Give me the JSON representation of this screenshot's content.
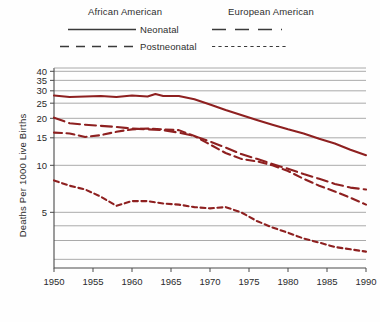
{
  "legend": {
    "group_titles": [
      {
        "id": "african-american",
        "label": "African American"
      },
      {
        "id": "european-american",
        "label": "European American"
      }
    ],
    "rows": [
      {
        "id": "neonatal",
        "label": "Neonatal"
      },
      {
        "id": "postneonatal",
        "label": "Postneonatal"
      }
    ]
  },
  "axes": {
    "ylabel": "Deaths Per 1000 Live Births",
    "xlabel": "Year"
  },
  "chart_data": {
    "type": "line",
    "title": "",
    "subtitle": "",
    "xlabel": "Year",
    "ylabel": "Deaths Per 1000 Live Births",
    "xlim": [
      1950,
      1990
    ],
    "xticks": [
      1950,
      1955,
      1960,
      1965,
      1970,
      1975,
      1980,
      1985,
      1990
    ],
    "xtick_labels": [
      "1950",
      "1955",
      "1960",
      "1965",
      "1970",
      "1975",
      "1980",
      "1985",
      "1990"
    ],
    "yscale": "log",
    "ylim": [
      2.2,
      42
    ],
    "yticks": [
      5,
      10,
      15,
      20,
      25,
      30,
      35,
      40
    ],
    "ytick_labels": [
      "5",
      "10",
      "15",
      "20",
      "25",
      "30",
      "35",
      "40"
    ],
    "gridlines": [
      5,
      10,
      15,
      20,
      25,
      30,
      35,
      40
    ],
    "grid": true,
    "legend_position": "above-plot",
    "line_color": "#8e2020",
    "series": [
      {
        "name": "African American Neonatal",
        "group": "African American",
        "measure": "Neonatal",
        "dash": "solid",
        "x": [
          1950,
          1952,
          1954,
          1956,
          1958,
          1960,
          1962,
          1963,
          1964,
          1966,
          1968,
          1970,
          1972,
          1974,
          1976,
          1978,
          1980,
          1982,
          1984,
          1986,
          1988,
          1990
        ],
        "values": [
          28.0,
          27.4,
          27.6,
          27.8,
          27.4,
          28.0,
          27.6,
          28.6,
          27.8,
          27.8,
          26.5,
          24.5,
          22.6,
          21.0,
          19.5,
          18.2,
          17.0,
          16.0,
          14.8,
          13.8,
          12.6,
          11.6
        ]
      },
      {
        "name": "African American Postneonatal",
        "group": "African American",
        "measure": "Postneonatal",
        "dash": "long-dash",
        "x": [
          1950,
          1952,
          1954,
          1956,
          1958,
          1960,
          1962,
          1964,
          1966,
          1968,
          1970,
          1972,
          1974,
          1976,
          1978,
          1980,
          1982,
          1984,
          1986,
          1988,
          1990
        ],
        "values": [
          20.2,
          18.6,
          18.2,
          17.9,
          17.6,
          17.2,
          17.0,
          16.8,
          16.2,
          15.4,
          14.2,
          13.0,
          11.8,
          11.0,
          10.2,
          9.5,
          8.8,
          8.2,
          7.6,
          7.2,
          7.0
        ]
      },
      {
        "name": "European American Neonatal",
        "group": "European American",
        "measure": "Neonatal",
        "dash": "medium-dash",
        "x": [
          1950,
          1952,
          1954,
          1956,
          1958,
          1960,
          1962,
          1964,
          1966,
          1968,
          1970,
          1972,
          1974,
          1976,
          1978,
          1980,
          1982,
          1984,
          1986,
          1988,
          1990
        ],
        "values": [
          16.2,
          16.0,
          15.2,
          15.6,
          16.4,
          17.0,
          17.2,
          17.0,
          16.8,
          15.4,
          13.6,
          12.0,
          11.0,
          10.6,
          10.0,
          9.2,
          8.2,
          7.4,
          6.8,
          6.2,
          5.6
        ]
      },
      {
        "name": "European American Postneonatal",
        "group": "European American",
        "measure": "Postneonatal",
        "dash": "fine-dash",
        "x": [
          1950,
          1952,
          1954,
          1956,
          1958,
          1960,
          1962,
          1964,
          1966,
          1968,
          1970,
          1972,
          1974,
          1976,
          1978,
          1980,
          1982,
          1984,
          1986,
          1988,
          1990
        ],
        "values": [
          8.0,
          7.4,
          7.0,
          6.3,
          5.5,
          5.9,
          5.9,
          5.7,
          5.6,
          5.4,
          5.3,
          5.4,
          5.0,
          4.4,
          4.0,
          3.7,
          3.4,
          3.2,
          3.0,
          2.9,
          2.8
        ]
      }
    ]
  }
}
